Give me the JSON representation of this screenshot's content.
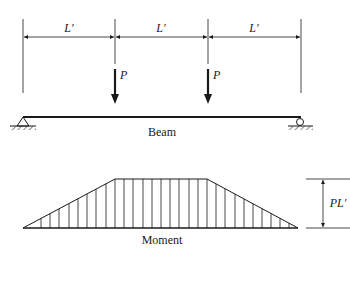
{
  "diagram": {
    "beam": {
      "label": "Beam",
      "span_labels": [
        "L′",
        "L′",
        "L′"
      ],
      "load_labels": [
        "P",
        "P"
      ],
      "supports": [
        "pin",
        "roller"
      ]
    },
    "moment": {
      "label": "Moment",
      "max_label": "PL′",
      "shape": "trapezoid"
    },
    "colors": {
      "ink": "#1a1a1a",
      "background": "#ffffff"
    }
  }
}
